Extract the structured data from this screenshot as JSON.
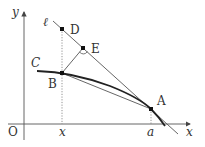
{
  "diagram": {
    "axes": {
      "x_label": "x",
      "y_label": "y",
      "origin_label": "O"
    },
    "curve_label": "C",
    "line_label": "ℓ",
    "points": {
      "A": "A",
      "B": "B",
      "D": "D",
      "E": "E"
    },
    "tick_labels": {
      "x_tick": "x",
      "a_tick": "a"
    },
    "colors": {
      "stroke": "#333333",
      "curve": "#222222",
      "background": "#ffffff"
    }
  }
}
